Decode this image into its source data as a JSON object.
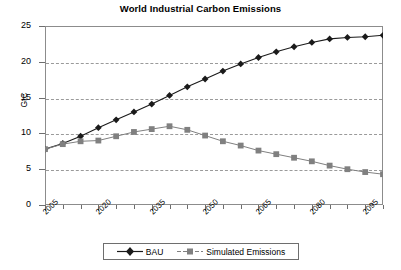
{
  "chart_data": {
    "type": "line",
    "title": "World Industrial Carbon Emissions",
    "xlabel": "",
    "ylabel": "GtC",
    "xlim": [
      2005,
      2100
    ],
    "ylim": [
      0,
      25
    ],
    "yticks": [
      0,
      5,
      10,
      15,
      20,
      25
    ],
    "xticks": [
      2005,
      2010,
      2015,
      2020,
      2025,
      2030,
      2035,
      2040,
      2045,
      2050,
      2055,
      2060,
      2065,
      2070,
      2075,
      2080,
      2085,
      2090,
      2095,
      2100
    ],
    "xtick_labels": [
      "2005",
      "2020",
      "2035",
      "2050",
      "2065",
      "2080",
      "2095"
    ],
    "xtick_labeled_values": [
      2005,
      2020,
      2035,
      2050,
      2065,
      2080,
      2095
    ],
    "grid": "horizontal-dashed",
    "legend_position": "bottom-center",
    "x": [
      2005,
      2010,
      2015,
      2020,
      2025,
      2030,
      2035,
      2040,
      2045,
      2050,
      2055,
      2060,
      2065,
      2070,
      2075,
      2080,
      2085,
      2090,
      2095,
      2100
    ],
    "series": [
      {
        "name": "BAU",
        "marker": "diamond",
        "color": "#1a1a1a",
        "values": [
          7.8,
          8.6,
          9.6,
          10.8,
          11.9,
          13.0,
          14.1,
          15.3,
          16.5,
          17.6,
          18.7,
          19.7,
          20.6,
          21.4,
          22.1,
          22.7,
          23.2,
          23.4,
          23.5,
          23.7
        ]
      },
      {
        "name": "Simulated Emissions",
        "marker": "square",
        "color": "#808080",
        "values": [
          7.8,
          8.5,
          8.9,
          9.0,
          9.6,
          10.2,
          10.6,
          11.0,
          10.5,
          9.7,
          8.9,
          8.3,
          7.6,
          7.1,
          6.6,
          6.1,
          5.5,
          5.0,
          4.6,
          4.3
        ]
      }
    ]
  },
  "legend": {
    "items": [
      {
        "label": "BAU"
      },
      {
        "label": "Simulated Emissions"
      }
    ]
  },
  "axis": {
    "y_label": "GtC",
    "y_tick_labels": [
      "25",
      "20",
      "15",
      "10",
      "5",
      "0"
    ]
  }
}
